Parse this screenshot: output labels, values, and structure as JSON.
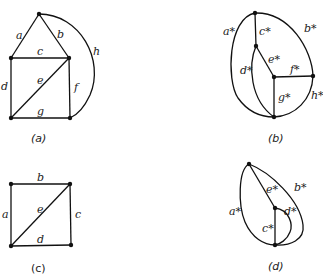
{
  "figures": {
    "a": {
      "caption": "(a)",
      "edge_labels": {
        "a": "a",
        "b": "b",
        "c": "c",
        "d": "d",
        "e": "e",
        "f": "f",
        "g": "g",
        "h": "h"
      }
    },
    "b": {
      "caption": "(b)",
      "edge_labels": {
        "a": "a*",
        "b": "b*",
        "c": "c*",
        "d": "d*",
        "e": "e*",
        "f": "f*",
        "g": "g*",
        "h": "h*"
      }
    },
    "c": {
      "caption": "(c)",
      "edge_labels": {
        "a": "a",
        "b": "b",
        "c": "c",
        "d": "d",
        "e": "e"
      }
    },
    "d": {
      "caption": "(d)",
      "edge_labels": {
        "a": "a*",
        "b": "b*",
        "c": "c*",
        "d": "d*",
        "e": "e*"
      }
    }
  }
}
